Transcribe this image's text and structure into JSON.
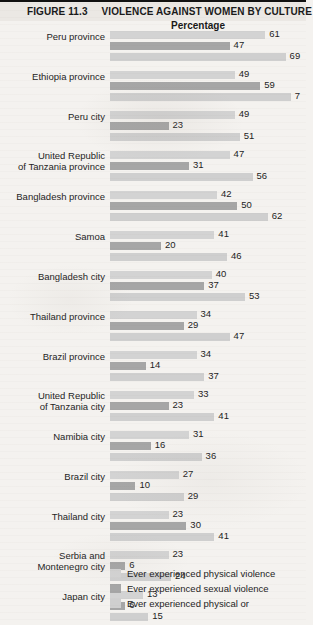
{
  "header": {
    "figure_number": "FIGURE 11.3",
    "title": "VIOLENCE AGAINST WOMEN BY CULTURE"
  },
  "chart_data": {
    "type": "bar",
    "orientation": "horizontal",
    "title": "VIOLENCE AGAINST WOMEN BY CULTURE",
    "xlabel": "Percentage",
    "ylabel": "",
    "xlim": [
      0,
      75
    ],
    "grid": false,
    "legend_position": "bottom",
    "categories": [
      "Peru province",
      "Ethiopia province",
      "Peru city",
      "United Republic of Tanzania province",
      "Bangladesh province",
      "Samoa",
      "Bangladesh city",
      "Thailand province",
      "Brazil province",
      "United Republic of Tanzania city",
      "Namibia city",
      "Brazil city",
      "Thailand city",
      "Serbia and Montenegro city",
      "Japan city"
    ],
    "series": [
      {
        "name": "Ever experienced physical violence",
        "color": "#d3d3d3",
        "values": [
          61,
          49,
          49,
          47,
          42,
          41,
          40,
          34,
          34,
          33,
          31,
          27,
          23,
          23,
          13
        ]
      },
      {
        "name": "Ever experienced sexual violence",
        "color": "#a6a6a6",
        "values": [
          47,
          59,
          23,
          31,
          50,
          20,
          37,
          29,
          14,
          23,
          16,
          10,
          30,
          6,
          6
        ]
      },
      {
        "name": "Ever experienced physical or",
        "color": "#cfcfcf",
        "values": [
          69,
          71,
          51,
          56,
          62,
          46,
          53,
          47,
          37,
          41,
          36,
          29,
          41,
          24,
          15
        ]
      }
    ],
    "value_labels": [
      [
        "61",
        "47",
        "69"
      ],
      [
        "49",
        "59",
        "7"
      ],
      [
        "49",
        "23",
        "51"
      ],
      [
        "47",
        "31",
        "56"
      ],
      [
        "42",
        "50",
        "62"
      ],
      [
        "41",
        "20",
        "46"
      ],
      [
        "40",
        "37",
        "53"
      ],
      [
        "34",
        "29",
        "47"
      ],
      [
        "34",
        "14",
        "37"
      ],
      [
        "33",
        "23",
        "41"
      ],
      [
        "31",
        "16",
        "36"
      ],
      [
        "27",
        "10",
        "29"
      ],
      [
        "23",
        "30",
        "41"
      ],
      [
        "23",
        "6",
        "24"
      ],
      [
        "13",
        "6",
        "15"
      ]
    ]
  },
  "category_label_lines": [
    [
      "Peru province"
    ],
    [
      "Ethiopia province"
    ],
    [
      "Peru city"
    ],
    [
      "United Republic",
      "of Tanzania province"
    ],
    [
      "Bangladesh province"
    ],
    [
      "Samoa"
    ],
    [
      "Bangladesh city"
    ],
    [
      "Thailand province"
    ],
    [
      "Brazil province"
    ],
    [
      "United Republic",
      "of Tanzania city"
    ],
    [
      "Namibia city"
    ],
    [
      "Brazil city"
    ],
    [
      "Thailand city"
    ],
    [
      "Serbia and",
      "Montenegro city"
    ],
    [
      "Japan city"
    ]
  ],
  "legend": [
    {
      "label": "Ever experienced physical violence",
      "color": "#d3d3d3"
    },
    {
      "label": "Ever experienced sexual violence",
      "color": "#a6a6a6"
    },
    {
      "label": "Ever experienced physical or",
      "color": "#cfcfcf"
    }
  ]
}
